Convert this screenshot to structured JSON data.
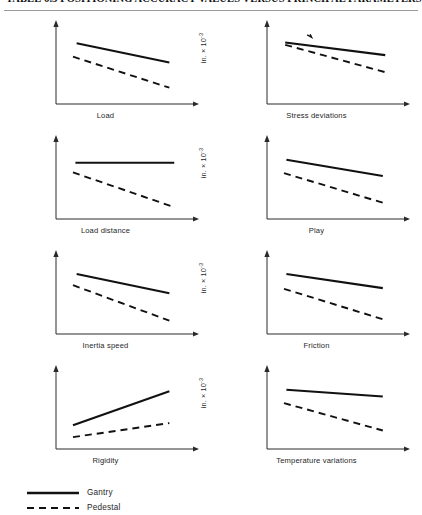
{
  "header": {
    "title": "TABLE 6.3  POSITIONING ACCURACY VALUES VERSUS PRINCIPAL PARAMETERS"
  },
  "axis": {
    "ylabel_text": "in. × 10",
    "ylabel_exponent": "-3"
  },
  "legend": {
    "items": [
      {
        "label": "Gantry",
        "style": "solid",
        "color": "#111111"
      },
      {
        "label": "Pedestal",
        "style": "dashed",
        "color": "#111111"
      }
    ]
  },
  "chart_data": [
    {
      "type": "line",
      "title": "Load",
      "xlabel": "Load",
      "ylabel": "in. × 10^-3",
      "grid": false,
      "xlim": [
        0,
        100
      ],
      "ylim": [
        0,
        100
      ],
      "series": [
        {
          "name": "Gantry",
          "style": "solid",
          "x": [
            12,
            88
          ],
          "values": [
            82,
            56
          ]
        },
        {
          "name": "Pedestal",
          "style": "dashed",
          "x": [
            9,
            88
          ],
          "values": [
            64,
            22
          ]
        }
      ]
    },
    {
      "type": "line",
      "title": "Stress deviations",
      "xlabel": "Stress deviations",
      "ylabel": "in. × 10^-3",
      "grid": false,
      "xlim": [
        0,
        100
      ],
      "ylim": [
        0,
        100
      ],
      "annotation": "tick-mark",
      "series": [
        {
          "name": "Gantry",
          "style": "solid",
          "x": [
            10,
            92
          ],
          "values": [
            83,
            66
          ]
        },
        {
          "name": "Pedestal",
          "style": "dashed",
          "x": [
            10,
            92
          ],
          "values": [
            80,
            43
          ]
        }
      ]
    },
    {
      "type": "line",
      "title": "Load distance",
      "xlabel": "Load distance",
      "ylabel": "in. × 10^-3",
      "grid": false,
      "xlim": [
        0,
        100
      ],
      "ylim": [
        0,
        100
      ],
      "series": [
        {
          "name": "Gantry",
          "style": "solid",
          "x": [
            11,
            92
          ],
          "values": [
            76,
            76
          ]
        },
        {
          "name": "Pedestal",
          "style": "dashed",
          "x": [
            9,
            92
          ],
          "values": [
            63,
            16
          ]
        }
      ]
    },
    {
      "type": "line",
      "title": "Play",
      "xlabel": "Play",
      "ylabel": "in. × 10^-3",
      "grid": false,
      "xlim": [
        0,
        100
      ],
      "ylim": [
        0,
        100
      ],
      "series": [
        {
          "name": "Gantry",
          "style": "solid",
          "x": [
            11,
            90
          ],
          "values": [
            80,
            58
          ]
        },
        {
          "name": "Pedestal",
          "style": "dashed",
          "x": [
            9,
            90
          ],
          "values": [
            62,
            22
          ]
        }
      ]
    },
    {
      "type": "line",
      "title": "Inertia speed",
      "xlabel": "Inertia speed",
      "ylabel": "in. × 10^-3",
      "grid": false,
      "xlim": [
        0,
        100
      ],
      "ylim": [
        0,
        100
      ],
      "series": [
        {
          "name": "Gantry",
          "style": "solid",
          "x": [
            12,
            88
          ],
          "values": [
            81,
            55
          ]
        },
        {
          "name": "Pedestal",
          "style": "dashed",
          "x": [
            9,
            88
          ],
          "values": [
            66,
            18
          ]
        }
      ]
    },
    {
      "type": "line",
      "title": "Friction",
      "xlabel": "Friction",
      "ylabel": "in. × 10^-3",
      "grid": false,
      "xlim": [
        0,
        100
      ],
      "ylim": [
        0,
        100
      ],
      "series": [
        {
          "name": "Gantry",
          "style": "solid",
          "x": [
            11,
            90
          ],
          "values": [
            81,
            62
          ]
        },
        {
          "name": "Pedestal",
          "style": "dashed",
          "x": [
            9,
            90
          ],
          "values": [
            61,
            20
          ]
        }
      ]
    },
    {
      "type": "line",
      "title": "Rigidity",
      "xlabel": "Rigidity",
      "ylabel": "in. × 10^-3",
      "grid": false,
      "xlim": [
        0,
        100
      ],
      "ylim": [
        0,
        100
      ],
      "series": [
        {
          "name": "Gantry",
          "style": "solid",
          "x": [
            9,
            88
          ],
          "values": [
            32,
            78
          ]
        },
        {
          "name": "Pedestal",
          "style": "dashed",
          "x": [
            9,
            88
          ],
          "values": [
            16,
            35
          ]
        }
      ]
    },
    {
      "type": "line",
      "title": "Temperature variations",
      "xlabel": "Temperature variations",
      "ylabel": "in. × 10^-3",
      "grid": false,
      "xlim": [
        0,
        100
      ],
      "ylim": [
        0,
        100
      ],
      "series": [
        {
          "name": "Gantry",
          "style": "solid",
          "x": [
            11,
            90
          ],
          "values": [
            80,
            71
          ]
        },
        {
          "name": "Pedestal",
          "style": "dashed",
          "x": [
            9,
            90
          ],
          "values": [
            62,
            25
          ]
        }
      ]
    }
  ]
}
